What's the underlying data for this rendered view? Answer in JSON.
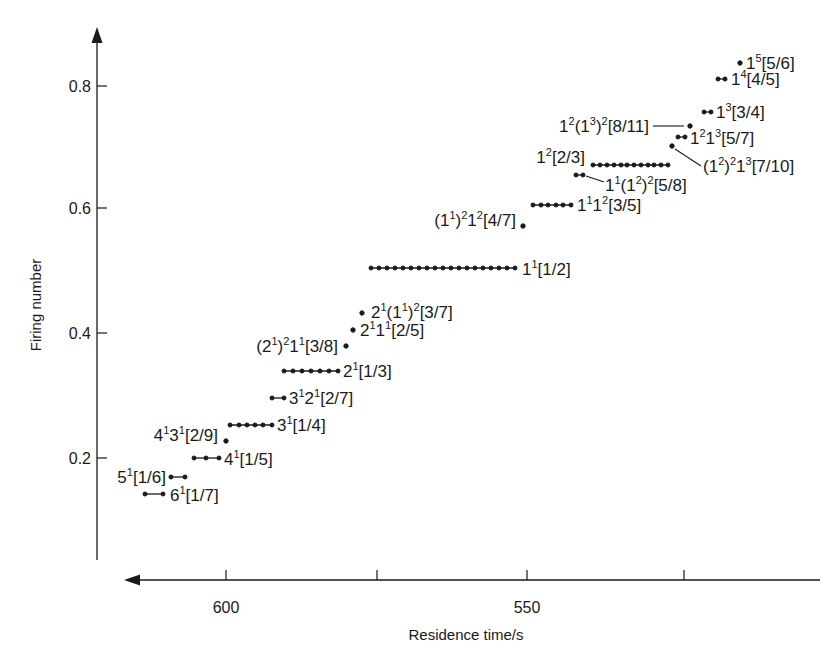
{
  "chart_data": {
    "type": "scatter",
    "title": "",
    "xlabel": "Residence time/s",
    "ylabel": "Firing number",
    "x_axis": {
      "reversed": true,
      "ticks": [
        600,
        575,
        550,
        525
      ],
      "tick_labels": [
        "600",
        "",
        "550",
        ""
      ],
      "range_px_note": "axis arrow points left (increasing residence time)"
    },
    "y_axis": {
      "ticks": [
        0.2,
        0.4,
        0.6,
        0.8
      ],
      "tick_labels": [
        "0.2",
        "0.4",
        "0.6",
        "0.8"
      ]
    },
    "grid": false,
    "legend": null,
    "series": [
      {
        "label": "6¹[1/7]",
        "base": "6",
        "sup": "1",
        "bracket": "[1/7]",
        "firing_number": 0.1429,
        "t_range": [
          613,
          610
        ],
        "dots": 2
      },
      {
        "label": "5¹[1/6]",
        "base": "5",
        "sup": "1",
        "bracket": "[1/6]",
        "firing_number": 0.1667,
        "t_range": [
          609,
          607
        ],
        "dots": 2
      },
      {
        "label": "4¹[1/5]",
        "bracket": "[1/5]",
        "firing_number": 0.2,
        "t_range": [
          606,
          601.5
        ],
        "dots": 3
      },
      {
        "label": "4¹3¹[2/9]",
        "bracket": "[2/9]",
        "firing_number": 0.2222,
        "t_range": [
          600.5,
          600.5
        ],
        "dots": 1
      },
      {
        "label": "3¹[1/4]",
        "bracket": "[1/4]",
        "firing_number": 0.25,
        "t_range": [
          599.5,
          592.5
        ],
        "dots": 6
      },
      {
        "label": "3¹2¹[2/7]",
        "bracket": "[2/7]",
        "firing_number": 0.2857,
        "t_range": [
          592.5,
          590.5
        ],
        "dots": 2
      },
      {
        "label": "2¹[1/3]",
        "bracket": "[1/3]",
        "firing_number": 0.3333,
        "t_range": [
          590.5,
          581.5
        ],
        "dots": 7
      },
      {
        "label": "(2¹)²1¹[3/8]",
        "bracket": "[3/8]",
        "firing_number": 0.375,
        "t_range": [
          580,
          580
        ],
        "dots": 1
      },
      {
        "label": "2¹1¹[2/5]",
        "bracket": "[2/5]",
        "firing_number": 0.4,
        "t_range": [
          579,
          579
        ],
        "dots": 1
      },
      {
        "label": "2¹(1¹)²[3/7]",
        "bracket": "[3/7]",
        "firing_number": 0.4286,
        "t_range": [
          577.5,
          577.5
        ],
        "dots": 1
      },
      {
        "label": "1¹[1/2]",
        "bracket": "[1/2]",
        "firing_number": 0.5,
        "t_range": [
          575.5,
          551.5
        ],
        "dots": 19
      },
      {
        "label": "(1¹)²1²[4/7]",
        "bracket": "[4/7]",
        "firing_number": 0.5714,
        "t_range": [
          549,
          549
        ],
        "dots": 1
      },
      {
        "label": "1¹1²[3/5]",
        "bracket": "[3/5]",
        "firing_number": 0.6,
        "t_range": [
          547.5,
          541
        ],
        "dots": 6
      },
      {
        "label": "1¹(1²)²[5/8]",
        "bracket": "[5/8]",
        "firing_number": 0.625,
        "t_range": [
          540,
          539
        ],
        "dots": 2
      },
      {
        "label": "1²[2/3]",
        "bracket": "[2/3]",
        "firing_number": 0.6667,
        "t_range": [
          537,
          524.5
        ],
        "dots": 12
      },
      {
        "label": "(1²)²1³[7/10]",
        "bracket": "[7/10]",
        "firing_number": 0.7,
        "t_range": [
          524,
          524
        ],
        "dots": 1
      },
      {
        "label": "1²1³[5/7]",
        "bracket": "[5/7]",
        "firing_number": 0.7143,
        "t_range": [
          523,
          522
        ],
        "dots": 2
      },
      {
        "label": "1²(1³)²[8/11]",
        "bracket": "[8/11]",
        "firing_number": 0.7273,
        "t_range": [
          521,
          521
        ],
        "dots": 1
      },
      {
        "label": "1³[3/4]",
        "bracket": "[3/4]",
        "firing_number": 0.75,
        "t_range": [
          520,
          519
        ],
        "dots": 2
      },
      {
        "label": "1⁴[4/5]",
        "bracket": "[4/5]",
        "firing_number": 0.8,
        "t_range": [
          517.5,
          516.5
        ],
        "dots": 2
      },
      {
        "label": "1⁵[5/6]",
        "bracket": "[5/6]",
        "firing_number": 0.8333,
        "t_range": [
          514,
          514
        ],
        "dots": 1
      }
    ]
  },
  "axes": {
    "xlabel": "Residence time/s",
    "ylabel": "Firing number",
    "x_ticks": [
      "600",
      "550"
    ],
    "y_ticks": [
      "0.8",
      "0.6",
      "0.4",
      "0.2"
    ]
  }
}
